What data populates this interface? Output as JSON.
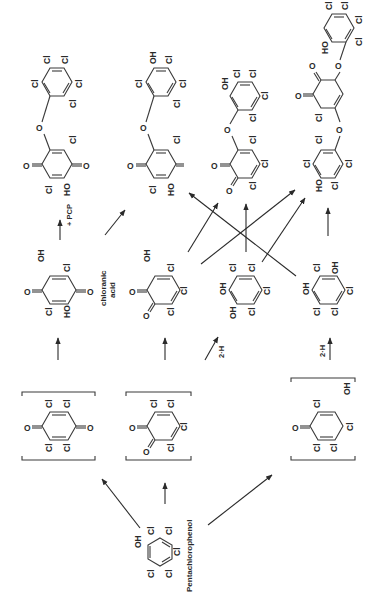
{
  "figure": {
    "orientation": "rotated 90 degrees counterclockwise",
    "compounds": {
      "pcp": {
        "name": "Pentachlorophenol",
        "substituents": [
          "OH",
          "Cl",
          "Cl",
          "Cl",
          "Cl",
          "Cl"
        ]
      },
      "p_chloranil": {
        "type": "p-quinone (bracketed intermediate)",
        "substituents": [
          "O",
          "Cl",
          "Cl",
          "O",
          "Cl",
          "Cl"
        ]
      },
      "o_chloranil": {
        "type": "o-quinone (bracketed intermediate)",
        "substituents": [
          "O",
          "O",
          "Cl",
          "Cl",
          "Cl",
          "Cl"
        ]
      },
      "cyclohexadienone": {
        "type": "bracketed intermediate",
        "substituents": [
          "O",
          "Cl",
          "Cl",
          "Cl",
          "Cl",
          "OH"
        ]
      },
      "chloranilic_acid": {
        "name": "chloranilic acid",
        "substituents": [
          "O",
          "Cl",
          "OH",
          "O",
          "Cl",
          "HO"
        ]
      },
      "hydroxy_o_quinone": {
        "substituents": [
          "O",
          "O",
          "Cl",
          "Cl",
          "Cl",
          "OH"
        ]
      },
      "tetrachlorocatechol": {
        "substituents": [
          "OH",
          "OH",
          "Cl",
          "Cl",
          "Cl",
          "Cl"
        ]
      },
      "tetrachlorohydroquinone_like": {
        "substituents": [
          "OH",
          "Cl",
          "OH",
          "Cl",
          "Cl",
          "Cl"
        ]
      },
      "dimer_1": {
        "substituents_ring_a": [
          "Cl",
          "Cl",
          "Cl",
          "Cl",
          "Cl"
        ],
        "substituents_ring_b": [
          "O",
          "Cl",
          "O",
          "HO",
          "Cl"
        ]
      },
      "dimer_2": {
        "substituents_ring_a": [
          "Cl",
          "OH",
          "Cl",
          "Cl",
          "Cl"
        ],
        "substituents_ring_b": [
          "O",
          "Cl",
          "O",
          "HO",
          "Cl"
        ]
      },
      "dimer_3": {
        "substituents_ring_a": [
          "OH",
          "Cl",
          "Cl",
          "Cl",
          "Cl"
        ],
        "substituents_ring_b": [
          "O",
          "O",
          "Cl",
          "Cl",
          "Cl"
        ]
      },
      "trimer": {
        "substituents_ring_a": [
          "HO",
          "Cl",
          "Cl",
          "Cl",
          "Cl"
        ],
        "substituents_ring_b": [
          "O",
          "O",
          "Cl"
        ],
        "substituents_ring_c": [
          "Cl",
          "Cl",
          "Cl",
          "HO",
          "Cl"
        ]
      }
    },
    "labels": {
      "pcp": "Pentachlorophenol",
      "chloranilic_1": "chloranic",
      "chloranilic_2": "acid",
      "plus_pcp": "+ PCP",
      "two_h_1": "2·H",
      "two_h_2": "2·H"
    }
  }
}
